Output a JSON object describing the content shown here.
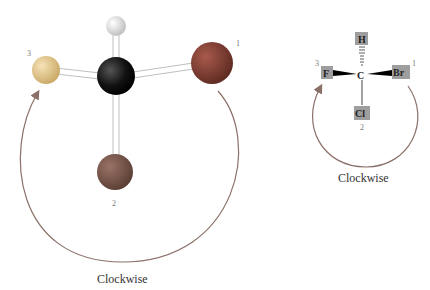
{
  "left_model": {
    "caption": "Clockwise",
    "priority_labels": {
      "p1": "1",
      "p2": "2",
      "p3": "3"
    },
    "atoms": [
      {
        "name": "carbon",
        "color": "#111111"
      },
      {
        "name": "hydrogen",
        "color": "#d8d8d8"
      },
      {
        "name": "priority-1",
        "color": "#8a3a2e"
      },
      {
        "name": "priority-2",
        "color": "#7a5a4e"
      },
      {
        "name": "priority-3",
        "color": "#e0c48a"
      }
    ],
    "arrow_color": "#8a7068"
  },
  "right_model": {
    "caption": "Clockwise",
    "atoms": {
      "center": "C",
      "top": "H",
      "left": "F",
      "right": "Br",
      "bottom": "Cl"
    },
    "priority_labels": {
      "p1": "1",
      "p2": "2",
      "p3": "3"
    },
    "box_color": "#9e9e9e",
    "arrow_color": "#8a7068"
  }
}
